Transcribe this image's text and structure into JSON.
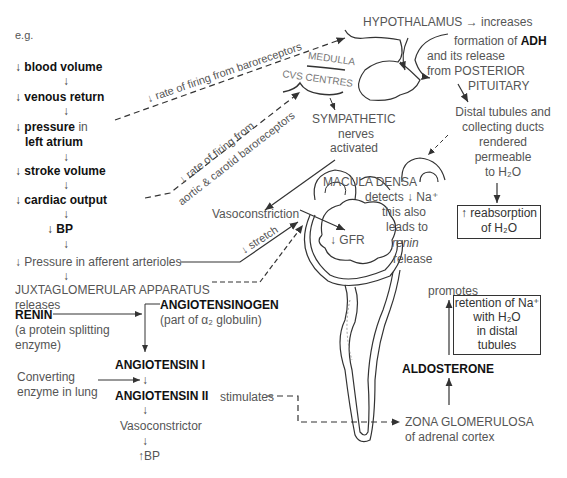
{
  "header": {
    "eg": "e.g."
  },
  "left_chain": [
    {
      "arrow": "↓",
      "bold": "blood volume",
      "rest": ""
    },
    {
      "arrow": "↓",
      "bold": "venous return",
      "rest": ""
    },
    {
      "arrow": "↓",
      "bold": "pressure",
      "rest": " in"
    },
    {
      "arrow": "",
      "bold": "left atrium",
      "rest": ""
    },
    {
      "arrow": "↓",
      "bold": "stroke volume",
      "rest": ""
    },
    {
      "arrow": "↓",
      "bold": "cardiac output",
      "rest": ""
    },
    {
      "arrow": "↓",
      "bold": "BP",
      "rest": ""
    }
  ],
  "afferent": "↓ Pressure in afferent arterioles",
  "jga": "JUXTAGLOMERULAR APPARATUS",
  "releases": "releases",
  "renin": "RENIN",
  "renin_desc1": "(a protein splitting",
  "renin_desc2": "enzyme)",
  "angiotensinogen": "ANGIOTENSINOGEN",
  "angiotensinogen_desc": "(part of α₂ globulin)",
  "angiotensin1": "ANGIOTENSIN I",
  "converting1": "Converting",
  "converting2": "enzyme in lung",
  "angiotensin2": "ANGIOTENSIN II",
  "stimulates": "stimulates",
  "vasoconstrictor": "Vasoconstrictor",
  "bp_up": "↑BP",
  "baro_label": "↓ rate of firing from baroreceptors",
  "aortic_label1": "↓ rate of firing from",
  "aortic_label2": "aortic & carotid baroreceptors",
  "medulla": "MEDULLA",
  "cvs_centres": "CVS CENTRES",
  "sympathetic": "SYMPATHETIC",
  "nerves": "nerves",
  "activated": "activated",
  "hypothalamus": "HYPOTHALAMUS → increases",
  "formation": "formation of ",
  "adh": "ADH",
  "release1": "and its release",
  "release2": "from POSTERIOR",
  "pituitary": "PITUITARY",
  "distal1": "Distal tubules and",
  "distal2": "collecting ducts",
  "distal3": "rendered",
  "distal4": "permeable",
  "distal5": "to H₂O",
  "reabsorption1": "↑ reabsorption",
  "reabsorption2": "of H₂O",
  "macula": "MACULA DENSA",
  "detects": "detects ↓ Na⁺",
  "also1": "this also",
  "also2": "leads to",
  "also3": "renin",
  "also4": "release",
  "vasoconstriction": "Vasoconstriction",
  "stretch": "↓ stretch",
  "gfr": "↓ GFR",
  "promotes": "promotes",
  "retention1": "retention of Na⁺",
  "retention2": "with H₂O",
  "retention3": "in distal",
  "retention4": "tubules",
  "aldosterone": "ALDOSTERONE",
  "zona1": "ZONA GLOMERULOSA",
  "zona2": "of adrenal cortex"
}
